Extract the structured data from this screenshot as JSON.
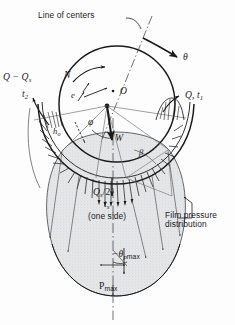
{
  "figure": {
    "background_color": "#fdfdfd",
    "line_color": "#1b1b1b",
    "fill_color": "#e3e4e6"
  },
  "labels": {
    "line_of_centers": "Line of centers",
    "theta": "θ",
    "rotation_speed": "N",
    "eccentricity": "e",
    "center": "O",
    "inflow": "Q, t",
    "inflow_sub": "1",
    "outflow": "Q − Q",
    "outflow_sub": "s",
    "outflow_temp": "t",
    "outflow_temp_sub": "2",
    "min_film": "h",
    "min_film_sub": "o",
    "attitude_angle": "φ",
    "load": "W",
    "beta": "β",
    "side_flow": "Q",
    "side_flow_sub": "s",
    "side_flow_div": "/2",
    "side_temp": "t",
    "side_temp_sub": "s",
    "one_side": "(one side)",
    "film_pressure_line1": "Film pressure",
    "film_pressure_line2": "distribution",
    "theta_p_max": "−θ",
    "theta_p_max_sub_p": "p",
    "theta_p_max_sub_max": "max",
    "p_max": "P",
    "p_max_sub": "max"
  }
}
